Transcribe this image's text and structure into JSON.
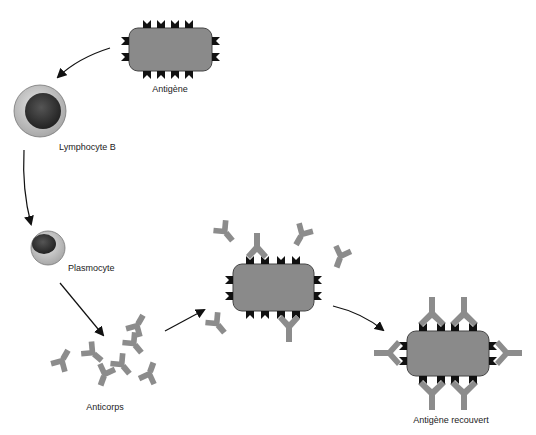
{
  "diagram": {
    "labels": {
      "antigen": "Antigène",
      "lymphocyte": "Lymphocyte B",
      "plasmocyte": "Plasmocyte",
      "antibodies": "Anticorps",
      "covered_antigen": "Antigène recouvert"
    },
    "colors": {
      "antigen_fill": "#8a8a8a",
      "antigen_stroke": "#444444",
      "epitope": "#111111",
      "antibody": "#8c8c8c",
      "cell_outer": "#c8c8c8",
      "cell_nucleus": "#3a3a3a",
      "arrow": "#111111"
    },
    "flow": [
      {
        "from": "Antigène",
        "to": "Lymphocyte B"
      },
      {
        "from": "Lymphocyte B",
        "to": "Plasmocyte"
      },
      {
        "from": "Plasmocyte",
        "to": "Anticorps"
      },
      {
        "from": "Anticorps",
        "to": "Antigène"
      },
      {
        "from": "Antigène",
        "to": "Antigène recouvert"
      }
    ]
  }
}
